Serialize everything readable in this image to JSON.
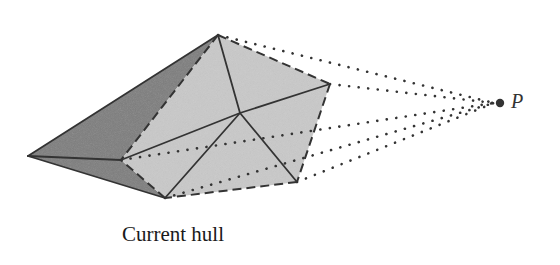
{
  "diagram": {
    "caption": "Current hull",
    "point_label": "P",
    "colors": {
      "background": "#ffffff",
      "dark_face": "#7d7d7d",
      "light_face": "#c9c9c9",
      "edge": "#333333",
      "point": "#333333"
    },
    "vertices": {
      "left_tip": [
        28,
        156
      ],
      "top": [
        218,
        35
      ],
      "right": [
        330,
        84
      ],
      "inner_left": [
        121,
        160
      ],
      "bottom": [
        165,
        198
      ],
      "bottom_right": [
        297,
        182
      ],
      "center": [
        240,
        113
      ],
      "P": [
        500,
        103
      ]
    },
    "dark_faces": [
      [
        "left_tip",
        "top",
        "inner_left"
      ],
      [
        "left_tip",
        "inner_left",
        "bottom"
      ]
    ],
    "light_faces": [
      [
        "top",
        "right",
        "bottom_right",
        "bottom",
        "inner_left"
      ]
    ],
    "solid_edges": [
      [
        "left_tip",
        "top"
      ],
      [
        "left_tip",
        "inner_left"
      ],
      [
        "left_tip",
        "bottom"
      ],
      [
        "top",
        "center"
      ],
      [
        "inner_left",
        "center"
      ],
      [
        "center",
        "right"
      ],
      [
        "center",
        "bottom"
      ],
      [
        "center",
        "bottom_right"
      ]
    ],
    "dashed_edges": [
      [
        "top",
        "inner_left"
      ],
      [
        "top",
        "right"
      ],
      [
        "right",
        "bottom_right"
      ],
      [
        "bottom_right",
        "bottom"
      ],
      [
        "bottom",
        "inner_left"
      ]
    ],
    "dotted_rays": [
      "top",
      "right",
      "inner_left",
      "bottom_right",
      "bottom"
    ]
  }
}
